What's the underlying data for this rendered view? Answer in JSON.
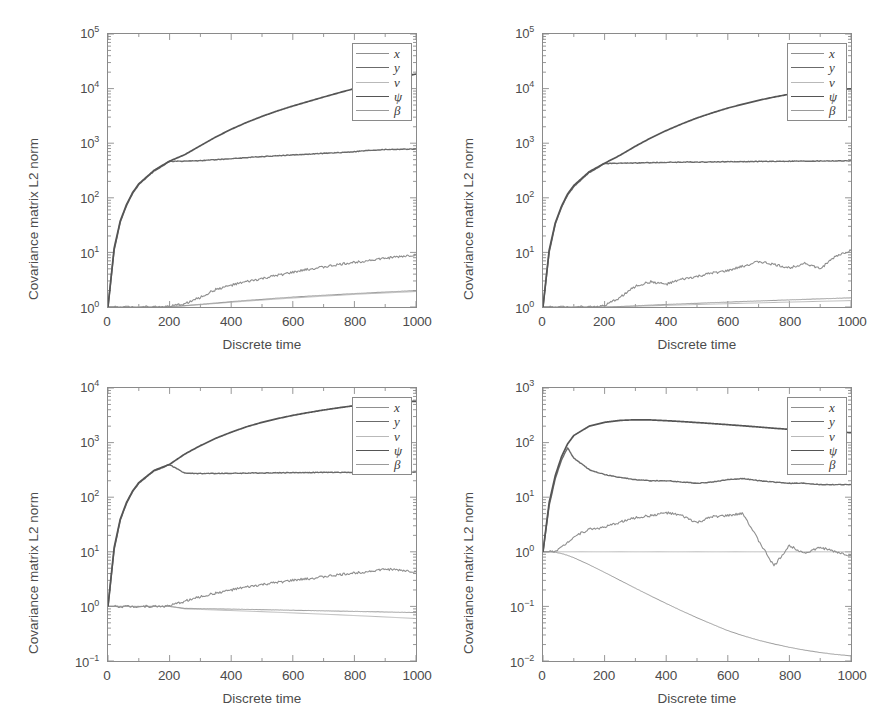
{
  "figure": {
    "width": 870,
    "height": 727,
    "background": "#ffffff",
    "axis_color": "#8a8a8a",
    "text_color": "#4c4c4c"
  },
  "series_styles": [
    {
      "key": "x",
      "label": "x",
      "color": "#8f8f8f",
      "width": 1.1,
      "dash": "none"
    },
    {
      "key": "y",
      "label": "y",
      "color": "#6b6b6b",
      "width": 1.4,
      "dash": "none"
    },
    {
      "key": "v",
      "label": "v",
      "color": "#b9b9b9",
      "width": 1.0,
      "dash": "none"
    },
    {
      "key": "psi",
      "label": "ψ",
      "color": "#555555",
      "width": 1.7,
      "dash": "none"
    },
    {
      "key": "betadot",
      "label": "β",
      "color": "#9a9a9a",
      "width": 1.0,
      "dash": "none",
      "accent": "˙"
    }
  ],
  "legend": {
    "entries": [
      "x",
      "y",
      "v",
      "ψ",
      "β"
    ],
    "beta_accent": "˙"
  },
  "axis_titles": {
    "x": "Discrete time",
    "y": "Covariance matrix L2 norm"
  },
  "xaxis": {
    "ticks": [
      0,
      200,
      400,
      600,
      800,
      1000
    ],
    "tick_labels": [
      "0",
      "200",
      "400",
      "600",
      "800",
      "1000"
    ],
    "min": 0,
    "max": 1000,
    "label": "Discrete time"
  },
  "chart_data": [
    {
      "id": "top-left",
      "type": "line",
      "title": "",
      "xlabel": "Discrete time",
      "ylabel": "Covariance matrix L2 norm",
      "xlim": [
        0,
        1000
      ],
      "ylim": [
        1,
        100000
      ],
      "yscale": "log",
      "xscale": "linear",
      "ytick_exponents": [
        0,
        1,
        2,
        3,
        4,
        5
      ],
      "ytick_labels": [
        "10⁰",
        "10¹",
        "10²",
        "10³",
        "10⁴",
        "10⁵"
      ],
      "xticks": [
        0,
        200,
        400,
        600,
        800,
        1000
      ],
      "grid": false,
      "legend_position": "top-right",
      "x": [
        0,
        20,
        40,
        60,
        80,
        100,
        150,
        200,
        250,
        300,
        350,
        400,
        450,
        500,
        550,
        600,
        650,
        700,
        750,
        800,
        850,
        900,
        950,
        1000
      ],
      "series": [
        {
          "name": "psi",
          "label": "ψ",
          "values": [
            1.0,
            12,
            38,
            75,
            125,
            180,
            320,
            470,
            620,
            900,
            1300,
            1800,
            2400,
            3100,
            3900,
            4800,
            5800,
            7000,
            8400,
            10000,
            11800,
            13800,
            16000,
            18500
          ]
        },
        {
          "name": "y",
          "label": "y",
          "values": [
            1.0,
            11,
            36,
            72,
            120,
            175,
            310,
            465,
            470,
            480,
            500,
            520,
            545,
            570,
            590,
            610,
            630,
            650,
            672,
            700,
            740,
            765,
            775,
            780
          ]
        },
        {
          "name": "x",
          "label": "x",
          "values": [
            1.0,
            1.0,
            1.0,
            1.0,
            1.0,
            1.0,
            1.0,
            1.02,
            1.15,
            1.5,
            2.1,
            2.5,
            2.9,
            3.3,
            3.8,
            4.3,
            4.9,
            5.4,
            6.0,
            6.6,
            7.2,
            7.8,
            8.4,
            9.0
          ]
        },
        {
          "name": "betadot",
          "label": "β",
          "values": [
            1.0,
            1.0,
            1.0,
            1.0,
            1.0,
            1.0,
            1.0,
            1.01,
            1.06,
            1.12,
            1.18,
            1.25,
            1.32,
            1.38,
            1.45,
            1.52,
            1.58,
            1.64,
            1.7,
            1.76,
            1.82,
            1.88,
            1.94,
            2.0
          ]
        },
        {
          "name": "v",
          "label": "v",
          "values": [
            1.0,
            1.0,
            1.0,
            1.0,
            1.0,
            1.0,
            1.0,
            1.01,
            1.05,
            1.1,
            1.16,
            1.22,
            1.28,
            1.34,
            1.4,
            1.46,
            1.52,
            1.58,
            1.64,
            1.7,
            1.76,
            1.81,
            1.86,
            1.92
          ]
        }
      ]
    },
    {
      "id": "top-right",
      "type": "line",
      "title": "",
      "xlabel": "Discrete time",
      "ylabel": "Covariance matrix L2 norm",
      "xlim": [
        0,
        1000
      ],
      "ylim": [
        1,
        100000
      ],
      "yscale": "log",
      "xscale": "linear",
      "ytick_exponents": [
        0,
        1,
        2,
        3,
        4,
        5
      ],
      "ytick_labels": [
        "10⁰",
        "10¹",
        "10²",
        "10³",
        "10⁴",
        "10⁵"
      ],
      "xticks": [
        0,
        200,
        400,
        600,
        800,
        1000
      ],
      "grid": false,
      "legend_position": "top-right",
      "x": [
        0,
        20,
        40,
        60,
        80,
        100,
        150,
        200,
        250,
        300,
        350,
        400,
        450,
        500,
        550,
        600,
        650,
        700,
        750,
        800,
        850,
        900,
        950,
        1000
      ],
      "series": [
        {
          "name": "psi",
          "label": "ψ",
          "values": [
            1.0,
            11,
            35,
            70,
            118,
            168,
            300,
            430,
            600,
            880,
            1250,
            1700,
            2250,
            2900,
            3600,
            4400,
            5200,
            6100,
            7000,
            7900,
            8600,
            9200,
            9600,
            9900
          ]
        },
        {
          "name": "y",
          "label": "y",
          "values": [
            1.0,
            10,
            33,
            67,
            112,
            160,
            290,
            425,
            430,
            435,
            440,
            445,
            450,
            452,
            455,
            458,
            460,
            462,
            465,
            468,
            470,
            472,
            474,
            476
          ]
        },
        {
          "name": "x",
          "label": "x",
          "values": [
            1.0,
            1.0,
            1.0,
            1.0,
            1.0,
            1.0,
            1.0,
            1.05,
            1.5,
            2.4,
            2.9,
            2.6,
            3.2,
            3.6,
            4.2,
            4.6,
            5.6,
            6.8,
            6.0,
            5.2,
            6.4,
            5.0,
            8.5,
            11.0
          ]
        },
        {
          "name": "betadot",
          "label": "β",
          "values": [
            1.0,
            1.0,
            1.0,
            1.0,
            1.0,
            1.0,
            1.0,
            1.0,
            1.02,
            1.05,
            1.08,
            1.11,
            1.14,
            1.17,
            1.2,
            1.23,
            1.26,
            1.29,
            1.32,
            1.35,
            1.38,
            1.41,
            1.44,
            1.47
          ]
        },
        {
          "name": "v",
          "label": "v",
          "values": [
            1.0,
            1.0,
            1.0,
            1.0,
            1.0,
            1.0,
            1.0,
            1.0,
            1.01,
            1.03,
            1.05,
            1.07,
            1.09,
            1.11,
            1.13,
            1.15,
            1.17,
            1.19,
            1.21,
            1.23,
            1.25,
            1.27,
            1.29,
            1.31
          ]
        }
      ]
    },
    {
      "id": "bottom-left",
      "type": "line",
      "title": "",
      "xlabel": "Discrete time",
      "ylabel": "Covariance matrix L2 norm",
      "xlim": [
        0,
        1000
      ],
      "ylim": [
        0.1,
        10000
      ],
      "yscale": "log",
      "xscale": "linear",
      "ytick_exponents": [
        -1,
        0,
        1,
        2,
        3,
        4
      ],
      "ytick_labels": [
        "10⁻¹",
        "10⁰",
        "10¹",
        "10²",
        "10³",
        "10⁴"
      ],
      "xticks": [
        0,
        200,
        400,
        600,
        800,
        1000
      ],
      "grid": false,
      "legend_position": "top-right",
      "x": [
        0,
        20,
        40,
        60,
        80,
        100,
        150,
        200,
        250,
        300,
        350,
        400,
        450,
        500,
        550,
        600,
        650,
        700,
        750,
        800,
        850,
        900,
        950,
        1000
      ],
      "series": [
        {
          "name": "psi",
          "label": "ψ",
          "values": [
            1.0,
            12,
            40,
            80,
            130,
            185,
            310,
            400,
            620,
            880,
            1200,
            1550,
            1950,
            2350,
            2750,
            3150,
            3550,
            3950,
            4350,
            4750,
            5100,
            5400,
            5600,
            5700
          ]
        },
        {
          "name": "y",
          "label": "y",
          "values": [
            1.0,
            11,
            38,
            77,
            126,
            180,
            305,
            395,
            275,
            272,
            272,
            274,
            276,
            278,
            280,
            282,
            283,
            284,
            285,
            286,
            287,
            288,
            288,
            288
          ]
        },
        {
          "name": "x",
          "label": "x",
          "values": [
            1.0,
            1.0,
            1.0,
            1.0,
            1.0,
            1.0,
            1.0,
            1.02,
            1.25,
            1.5,
            1.75,
            2.0,
            2.25,
            2.5,
            2.75,
            3.0,
            3.2,
            3.5,
            3.8,
            4.1,
            4.4,
            4.8,
            4.6,
            4.3
          ]
        },
        {
          "name": "betadot",
          "label": "β",
          "values": [
            1.0,
            1.0,
            1.0,
            1.0,
            1.0,
            1.0,
            1.0,
            1.0,
            0.92,
            0.91,
            0.9,
            0.89,
            0.88,
            0.87,
            0.86,
            0.85,
            0.84,
            0.83,
            0.82,
            0.81,
            0.8,
            0.79,
            0.78,
            0.77
          ]
        },
        {
          "name": "v",
          "label": "v",
          "values": [
            1.0,
            1.0,
            1.0,
            1.0,
            1.0,
            1.0,
            1.0,
            1.0,
            0.9,
            0.88,
            0.86,
            0.84,
            0.82,
            0.8,
            0.78,
            0.76,
            0.74,
            0.72,
            0.7,
            0.68,
            0.66,
            0.64,
            0.62,
            0.6
          ]
        }
      ]
    },
    {
      "id": "bottom-right",
      "type": "line",
      "title": "",
      "xlabel": "Discrete time",
      "ylabel": "Covariance matrix L2 norm",
      "xlim": [
        0,
        1000
      ],
      "ylim": [
        0.01,
        1000
      ],
      "yscale": "log",
      "xscale": "linear",
      "ytick_exponents": [
        -2,
        -1,
        0,
        1,
        2,
        3
      ],
      "ytick_labels": [
        "10⁻²",
        "10⁻¹",
        "10⁰",
        "10¹",
        "10²",
        "10³"
      ],
      "xticks": [
        0,
        200,
        400,
        600,
        800,
        1000
      ],
      "grid": false,
      "legend_position": "top-right",
      "x": [
        0,
        20,
        40,
        60,
        80,
        100,
        150,
        200,
        250,
        300,
        350,
        400,
        450,
        500,
        550,
        600,
        650,
        700,
        750,
        800,
        850,
        900,
        950,
        1000
      ],
      "series": [
        {
          "name": "psi",
          "label": "ψ",
          "values": [
            1.0,
            8,
            25,
            55,
            95,
            135,
            200,
            235,
            255,
            262,
            260,
            252,
            243,
            233,
            223,
            213,
            203,
            193,
            183,
            175,
            168,
            162,
            157,
            152
          ]
        },
        {
          "name": "y",
          "label": "y",
          "values": [
            1.0,
            7,
            22,
            48,
            80,
            52,
            32,
            26,
            23,
            21,
            20,
            20,
            19,
            18,
            19,
            21,
            22,
            20,
            19,
            18,
            18,
            17,
            17,
            17
          ]
        },
        {
          "name": "x",
          "label": "x",
          "values": [
            1.0,
            1.0,
            1.05,
            1.2,
            1.5,
            1.9,
            2.6,
            2.8,
            3.5,
            4.2,
            4.6,
            5.2,
            4.6,
            3.4,
            4.4,
            4.6,
            5.0,
            1.6,
            0.55,
            1.3,
            0.95,
            1.2,
            1.0,
            0.85
          ]
        },
        {
          "name": "v",
          "label": "v",
          "values": [
            1.0,
            1.0,
            1.0,
            1.0,
            1.0,
            1.0,
            1.0,
            1.0,
            1.0,
            1.0,
            1.0,
            1.0,
            1.0,
            1.0,
            1.0,
            1.0,
            1.0,
            1.0,
            1.0,
            1.0,
            1.0,
            1.0,
            1.0,
            1.0
          ]
        },
        {
          "name": "betadot",
          "label": "β",
          "values": [
            1.0,
            1.0,
            0.98,
            0.93,
            0.86,
            0.78,
            0.58,
            0.42,
            0.3,
            0.215,
            0.155,
            0.113,
            0.083,
            0.062,
            0.047,
            0.036,
            0.029,
            0.024,
            0.0205,
            0.0178,
            0.0158,
            0.0143,
            0.0132,
            0.0124
          ]
        }
      ]
    }
  ]
}
